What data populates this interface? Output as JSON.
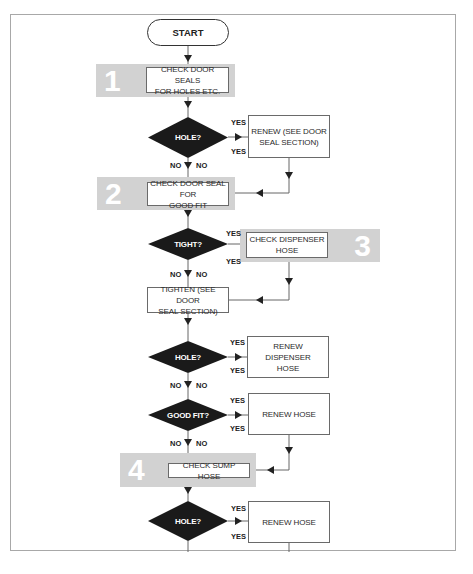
{
  "diagram": {
    "type": "flowchart",
    "start": "START",
    "steps": [
      {
        "number": "1",
        "label": "CHECK DOOR SEALS FOR HOLES ETC."
      },
      {
        "number": "2",
        "label": "CHECK DOOR SEAL FOR GOOD FIT"
      },
      {
        "number": "3",
        "label": "CHECK DISPENSER HOSE"
      },
      {
        "number": "4",
        "label": "CHECK SUMP HOSE"
      }
    ],
    "decisions": [
      {
        "label": "HOLE?",
        "yes": "YES",
        "no": "NO",
        "yes_action": "RENEW (SEE DOOR SEAL SECTION)"
      },
      {
        "label": "TIGHT?",
        "yes": "YES",
        "no": "NO",
        "yes_action": "CHECK DISPENSER HOSE"
      },
      {
        "label": "HOLE?",
        "yes": "YES",
        "no": "NO",
        "yes_action": "RENEW DISPENSER HOSE"
      },
      {
        "label": "GOOD FIT?",
        "yes": "YES",
        "no": "NO",
        "yes_action": "RENEW HOSE"
      },
      {
        "label": "HOLE?",
        "yes": "YES",
        "no": "NO",
        "yes_action": "RENEW HOSE"
      }
    ],
    "actions": {
      "renew_door_seal_l1": "RENEW (SEE DOOR",
      "renew_door_seal_l2": "SEAL SECTION)",
      "tighten_l1": "TIGHTEN (SEE DOOR",
      "tighten_l2": "SEAL SECTION)",
      "renew_dispenser_l1": "RENEW DISPENSER",
      "renew_dispenser_l2": "HOSE",
      "renew_hose": "RENEW HOSE"
    },
    "box_text": {
      "step1_l1": "CHECK DOOR SEALS",
      "step1_l2": "FOR HOLES ETC.",
      "step2_l1": "CHECK DOOR SEAL FOR",
      "step2_l2": "GOOD FIT",
      "step3_l1": "CHECK DISPENSER",
      "step3_l2": "HOSE",
      "step4": "CHECK SUMP HOSE"
    },
    "colors": {
      "band": "#d2d2d2",
      "diamond": "#1a1a1a",
      "line": "#555555"
    }
  }
}
